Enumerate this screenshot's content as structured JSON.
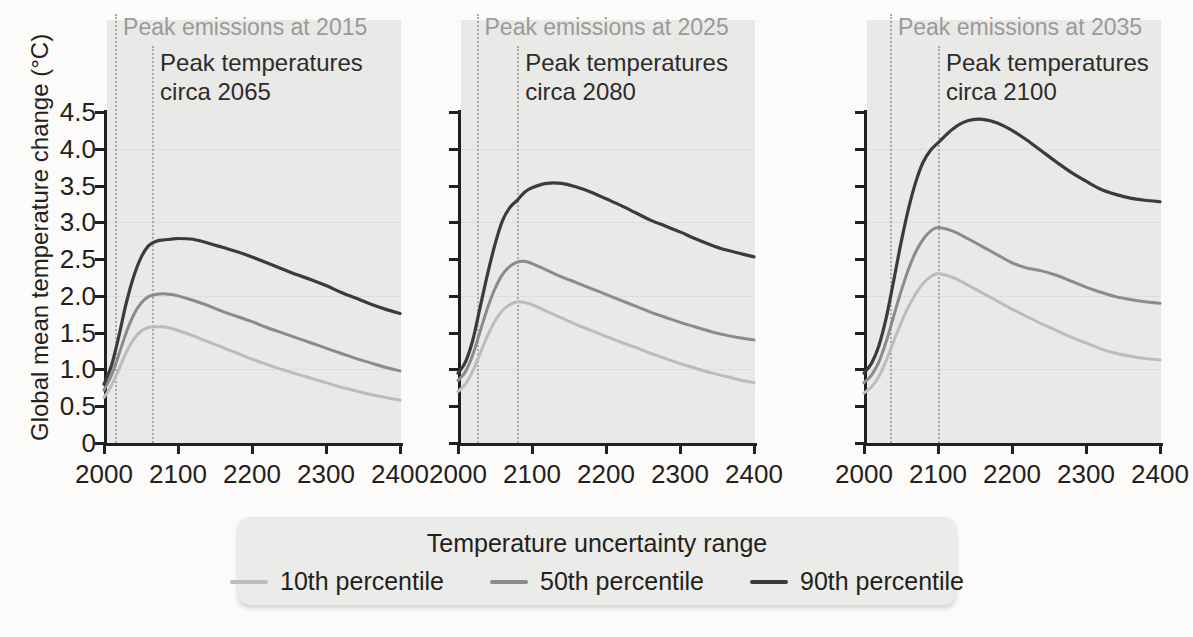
{
  "figure": {
    "ylabel": "Global mean temperature change (°C)",
    "y_ticks": [
      "4.5",
      "4.0",
      "3.5",
      "3.0",
      "2.5",
      "2.0",
      "1.5",
      "1.0",
      "0.5",
      "0"
    ],
    "x_ticks": [
      "2000",
      "2100",
      "2200",
      "2300",
      "2400"
    ]
  },
  "panels": [
    {
      "emissions_label": "Peak emissions at 2015",
      "temperature_label_line1": "Peak temperatures",
      "temperature_label_line2": "circa 2065",
      "peak_emissions_year": 2015,
      "peak_temperature_year": 2065
    },
    {
      "emissions_label": "Peak emissions at 2025",
      "temperature_label_line1": "Peak temperatures",
      "temperature_label_line2": "circa 2080",
      "peak_emissions_year": 2025,
      "peak_temperature_year": 2080
    },
    {
      "emissions_label": "Peak emissions at 2035",
      "temperature_label_line1": "Peak temperatures",
      "temperature_label_line2": "circa 2100",
      "peak_emissions_year": 2035,
      "peak_temperature_year": 2100
    }
  ],
  "legend": {
    "title": "Temperature uncertainty range",
    "items": [
      {
        "label": "10th percentile",
        "color": "#bcbcba"
      },
      {
        "label": "50th percentile",
        "color": "#8b8b89"
      },
      {
        "label": "90th percentile",
        "color": "#3d3a3b"
      }
    ]
  },
  "colors": {
    "p10": "#bcbcba",
    "p50": "#8b8b89",
    "p90": "#3d3a3b",
    "plot_background": "#e9e9e7",
    "page_background": "#fcfbf9",
    "axis": "#231f20",
    "emissions_text": "#9a9a98",
    "dotted_line": "#a8a8a6"
  },
  "chart_data": {
    "type": "line",
    "title": "",
    "xlabel": "",
    "ylabel": "Global mean temperature change (°C)",
    "xlim": [
      2000,
      2400
    ],
    "ylim": [
      0,
      4.5
    ],
    "ytick_values": [
      0,
      0.5,
      1.0,
      1.5,
      2.0,
      2.5,
      3.0,
      3.5,
      4.0,
      4.5
    ],
    "xtick_values": [
      2000,
      2100,
      2200,
      2300,
      2400
    ],
    "grid": "horizontal-dotted-faint",
    "legend_position": "bottom-center",
    "panels": [
      {
        "name": "Peak emissions at 2015",
        "peak_emissions_year": 2015,
        "peak_temperature_year": 2065,
        "x": [
          2000,
          2010,
          2020,
          2030,
          2040,
          2050,
          2060,
          2070,
          2080,
          2090,
          2100,
          2120,
          2140,
          2160,
          2180,
          2200,
          2220,
          2240,
          2260,
          2280,
          2300,
          2320,
          2340,
          2360,
          2380,
          2400
        ],
        "series": [
          {
            "name": "90th percentile",
            "color": "#3d3a3b",
            "values": [
              0.8,
              1.05,
              1.45,
              1.9,
              2.26,
              2.52,
              2.68,
              2.74,
              2.76,
              2.77,
              2.78,
              2.77,
              2.72,
              2.66,
              2.6,
              2.53,
              2.45,
              2.37,
              2.29,
              2.22,
              2.14,
              2.05,
              1.97,
              1.89,
              1.82,
              1.76
            ]
          },
          {
            "name": "50th percentile",
            "color": "#8b8b89",
            "values": [
              0.72,
              0.92,
              1.2,
              1.5,
              1.74,
              1.9,
              1.99,
              2.02,
              2.03,
              2.02,
              2.0,
              1.94,
              1.87,
              1.79,
              1.72,
              1.65,
              1.57,
              1.5,
              1.43,
              1.36,
              1.29,
              1.22,
              1.15,
              1.09,
              1.03,
              0.98
            ]
          },
          {
            "name": "10th percentile",
            "color": "#bcbcba",
            "values": [
              0.62,
              0.78,
              1.0,
              1.23,
              1.41,
              1.52,
              1.57,
              1.58,
              1.58,
              1.56,
              1.53,
              1.46,
              1.38,
              1.3,
              1.22,
              1.14,
              1.07,
              1.0,
              0.94,
              0.88,
              0.82,
              0.76,
              0.71,
              0.66,
              0.62,
              0.58
            ]
          }
        ]
      },
      {
        "name": "Peak emissions at 2025",
        "peak_emissions_year": 2025,
        "peak_temperature_year": 2080,
        "x": [
          2000,
          2010,
          2020,
          2030,
          2040,
          2050,
          2060,
          2070,
          2080,
          2090,
          2100,
          2120,
          2140,
          2160,
          2180,
          2200,
          2220,
          2240,
          2260,
          2280,
          2300,
          2320,
          2340,
          2360,
          2380,
          2400
        ],
        "series": [
          {
            "name": "90th percentile",
            "color": "#3d3a3b",
            "values": [
              0.95,
              1.1,
              1.4,
              1.85,
              2.3,
              2.7,
              3.02,
              3.2,
              3.3,
              3.41,
              3.47,
              3.53,
              3.53,
              3.48,
              3.41,
              3.32,
              3.23,
              3.13,
              3.03,
              2.95,
              2.87,
              2.78,
              2.7,
              2.63,
              2.58,
              2.53
            ]
          },
          {
            "name": "50th percentile",
            "color": "#8b8b89",
            "values": [
              0.85,
              0.97,
              1.2,
              1.52,
              1.84,
              2.1,
              2.29,
              2.4,
              2.46,
              2.47,
              2.44,
              2.35,
              2.26,
              2.18,
              2.1,
              2.02,
              1.94,
              1.86,
              1.78,
              1.71,
              1.64,
              1.58,
              1.52,
              1.47,
              1.43,
              1.4
            ]
          },
          {
            "name": "10th percentile",
            "color": "#bcbcba",
            "values": [
              0.7,
              0.8,
              0.98,
              1.22,
              1.46,
              1.66,
              1.8,
              1.88,
              1.92,
              1.91,
              1.88,
              1.79,
              1.7,
              1.61,
              1.53,
              1.45,
              1.37,
              1.3,
              1.22,
              1.15,
              1.08,
              1.02,
              0.96,
              0.91,
              0.86,
              0.82
            ]
          }
        ]
      },
      {
        "name": "Peak emissions at 2035",
        "peak_emissions_year": 2035,
        "peak_temperature_year": 2100,
        "x": [
          2000,
          2010,
          2020,
          2030,
          2040,
          2050,
          2060,
          2070,
          2080,
          2090,
          2100,
          2120,
          2140,
          2160,
          2180,
          2200,
          2220,
          2240,
          2260,
          2280,
          2300,
          2320,
          2340,
          2360,
          2380,
          2400
        ],
        "series": [
          {
            "name": "90th percentile",
            "color": "#3d3a3b",
            "values": [
              0.95,
              1.08,
              1.32,
              1.7,
              2.2,
              2.72,
              3.18,
              3.55,
              3.82,
              3.98,
              4.08,
              4.27,
              4.38,
              4.4,
              4.35,
              4.25,
              4.12,
              3.97,
              3.82,
              3.68,
              3.56,
              3.45,
              3.38,
              3.33,
              3.3,
              3.28
            ]
          },
          {
            "name": "50th percentile",
            "color": "#8b8b89",
            "values": [
              0.82,
              0.92,
              1.1,
              1.38,
              1.72,
              2.06,
              2.36,
              2.6,
              2.77,
              2.88,
              2.93,
              2.88,
              2.78,
              2.67,
              2.56,
              2.45,
              2.38,
              2.34,
              2.28,
              2.2,
              2.12,
              2.05,
              1.99,
              1.95,
              1.92,
              1.9
            ]
          },
          {
            "name": "10th percentile",
            "color": "#bcbcba",
            "values": [
              0.68,
              0.76,
              0.9,
              1.12,
              1.38,
              1.63,
              1.85,
              2.03,
              2.17,
              2.26,
              2.3,
              2.25,
              2.15,
              2.04,
              1.93,
              1.82,
              1.72,
              1.62,
              1.53,
              1.44,
              1.36,
              1.28,
              1.22,
              1.18,
              1.15,
              1.13
            ]
          }
        ]
      }
    ]
  }
}
